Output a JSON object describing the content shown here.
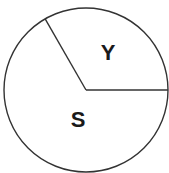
{
  "chart_data": {
    "type": "pie",
    "title": "",
    "categories": [
      "Y",
      "S"
    ],
    "values": [
      33.3,
      66.7
    ],
    "labels": [
      "Y",
      "S"
    ],
    "legend": "none",
    "slice_colors": [
      "#ffffff",
      "#ffffff"
    ],
    "outline_color": "#333333",
    "start_angle_deg": 0,
    "direction": "counterclockwise"
  },
  "labels": {
    "y": "Y",
    "s": "S"
  },
  "geometry": {
    "cx": 86,
    "cy": 90,
    "r": 82
  }
}
